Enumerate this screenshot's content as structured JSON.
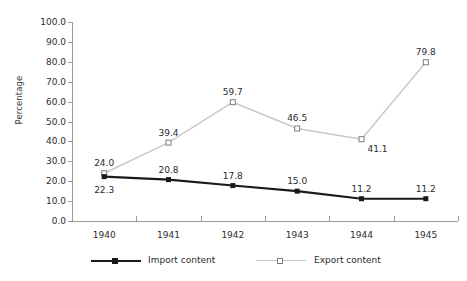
{
  "chart_data": {
    "type": "line",
    "title": "",
    "xlabel": "",
    "ylabel": "Percentage",
    "categories": [
      "1940",
      "1941",
      "1942",
      "1943",
      "1944",
      "1945"
    ],
    "ylim": [
      0,
      100
    ],
    "ytick_step": 10,
    "ytick_labels": [
      "100.0",
      "90.0",
      "80.0",
      "70.0",
      "60.0",
      "50.0",
      "40.0",
      "30.0",
      "20.0",
      "10.0",
      "0.0"
    ],
    "grid": false,
    "legend_position": "bottom",
    "series": [
      {
        "name": "Import content",
        "color": "#1a1a1a",
        "marker": "filled-square",
        "values": [
          22.3,
          20.8,
          17.8,
          15.0,
          11.2,
          11.2
        ],
        "data_labels": [
          "22.3",
          "20.8",
          "17.8",
          "15.0",
          "11.2",
          "11.2"
        ],
        "label_positions": [
          "below",
          "above",
          "above",
          "above",
          "above",
          "above"
        ]
      },
      {
        "name": "Export content",
        "color": "#c9c9c9",
        "marker": "open-square",
        "values": [
          24.0,
          39.4,
          59.7,
          46.5,
          41.1,
          79.8
        ],
        "data_labels": [
          "24.0",
          "39.4",
          "59.7",
          "46.5",
          "41.1",
          "79.8"
        ],
        "label_positions": [
          "above",
          "above",
          "above",
          "above",
          "right-below",
          "above"
        ]
      }
    ]
  },
  "legend": {
    "items": [
      {
        "label": "Import content",
        "marker": "filled-square",
        "color": "#1a1a1a"
      },
      {
        "label": "Export content",
        "marker": "open-square",
        "color": "#c9c9c9"
      }
    ]
  },
  "colors": {
    "background": "#ffffff",
    "axis": "#9a9a9a",
    "text": "#2b2b2b",
    "import_series": "#1a1a1a",
    "export_series": "#c9c9c9",
    "export_marker_stroke": "#7d7d7d"
  }
}
